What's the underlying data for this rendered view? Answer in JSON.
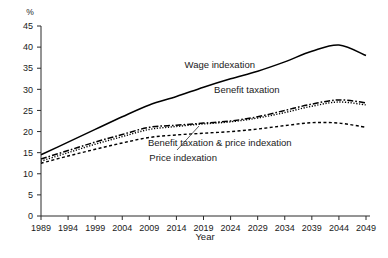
{
  "chart_data": {
    "type": "line",
    "title": "",
    "xlabel": "Year",
    "ylabel": "%",
    "yunit": "%",
    "xlim": [
      1989,
      2049
    ],
    "ylim": [
      0,
      45
    ],
    "ytick_step": 5,
    "xtick_step": 5,
    "grid": false,
    "legend": "inline-annotations",
    "x": [
      1989,
      1994,
      1999,
      2004,
      2009,
      2014,
      2019,
      2024,
      2029,
      2034,
      2039,
      2044,
      2049
    ],
    "xticklabels": [
      "1989",
      "1994",
      "1999",
      "2004",
      "2009",
      "2014",
      "2019",
      "2024",
      "2029",
      "2034",
      "2039",
      "2044",
      "2049"
    ],
    "yticklabels": [
      "0",
      "5",
      "10",
      "15",
      "20",
      "25",
      "30",
      "35",
      "40",
      "45"
    ],
    "series": [
      {
        "name": "Wage indexation",
        "style": "solid",
        "values": [
          14.5,
          17.5,
          20.5,
          23.5,
          26.3,
          28.3,
          30.5,
          32.5,
          34.3,
          36.5,
          39.0,
          40.5,
          38.0
        ],
        "label_x": 2022,
        "label_y": 35.0
      },
      {
        "name": "Benefit taxation",
        "style": "dash-dot",
        "values": [
          13.5,
          15.5,
          17.5,
          19.3,
          21.0,
          21.5,
          22.0,
          22.5,
          23.5,
          25.0,
          26.5,
          27.5,
          26.8
        ],
        "label_x": 2027,
        "label_y": 29.2
      },
      {
        "name": "Benefit taxation & price indexation",
        "style": "dotted",
        "values": [
          13.0,
          15.0,
          17.0,
          18.8,
          20.5,
          21.2,
          21.8,
          22.3,
          23.2,
          24.5,
          26.0,
          27.0,
          26.3
        ],
        "label_x": 2022,
        "label_y": 16.5
      },
      {
        "name": "Price indexation",
        "style": "dashed",
        "values": [
          12.5,
          14.2,
          15.8,
          17.3,
          18.6,
          19.2,
          19.6,
          20.0,
          20.6,
          21.4,
          22.1,
          22.0,
          21.0
        ],
        "label_x": 2009,
        "label_y": 13.0
      }
    ]
  },
  "axes": {
    "y_unit_label": "%",
    "x_axis_title": "Year"
  }
}
